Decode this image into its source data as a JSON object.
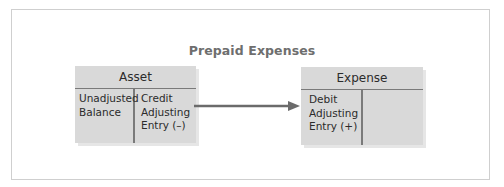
{
  "diagram": {
    "title": "Prepaid Expenses",
    "accounts": [
      {
        "name": "Asset",
        "left_side": [
          "Unadjusted",
          "Balance"
        ],
        "right_side": [
          "Credit",
          "Adjusting",
          "Entry (–)"
        ]
      },
      {
        "name": "Expense",
        "left_side": [
          "Debit",
          "Adjusting",
          "Entry (+)"
        ],
        "right_side": []
      }
    ],
    "arrow": {
      "from": "Asset credit side",
      "to": "Expense debit side",
      "icon": "arrow-right-icon"
    }
  },
  "colors": {
    "box_fill": "#d9d9d9",
    "rule_line": "#7a7a7a",
    "title_text": "#6e6e6e",
    "body_text": "#2b2b2b",
    "arrow": "#6b6b6b",
    "frame_border": "#cfcfcf"
  }
}
